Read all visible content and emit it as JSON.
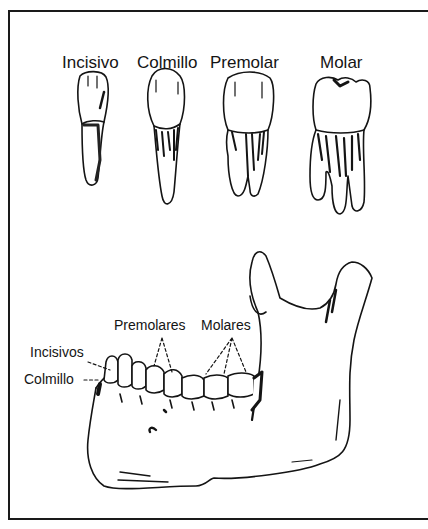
{
  "figure": {
    "type": "anatomical-diagram"
  },
  "tooth_types": [
    {
      "label": "Incisivo"
    },
    {
      "label": "Colmillo"
    },
    {
      "label": "Premolar"
    },
    {
      "label": "Molar"
    }
  ],
  "jaw_labels": {
    "premolares": "Premolares",
    "molares": "Molares",
    "incisivos": "Incisivos",
    "colmillo": "Colmillo"
  },
  "colors": {
    "ink": "#141414",
    "background": "#ffffff"
  }
}
